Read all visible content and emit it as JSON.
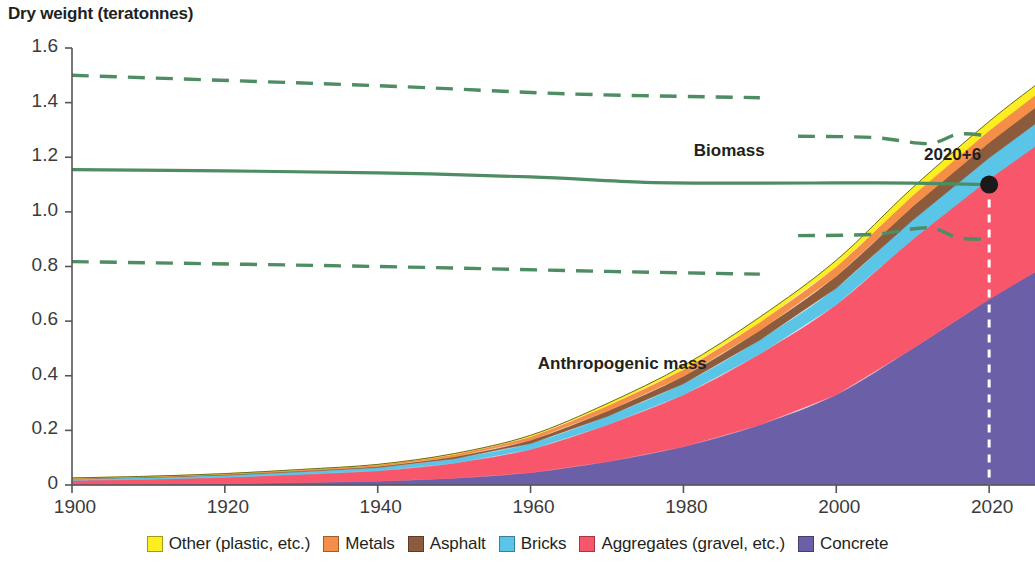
{
  "title": "Dry weight (teratonnes)",
  "labels": {
    "biomass": "Biomass",
    "anthropogenic": "Anthropogenic mass",
    "crossover_point": "2020+6"
  },
  "legend": {
    "items": [
      {
        "label": "Other (plastic, etc.)",
        "color": "#FCEE21"
      },
      {
        "label": "Metals",
        "color": "#F58E48"
      },
      {
        "label": "Asphalt",
        "color": "#8B5B3C"
      },
      {
        "label": "Bricks",
        "color": "#5BC5E8"
      },
      {
        "label": "Aggregates (gravel, etc.)",
        "color": "#F8576B"
      },
      {
        "label": "Concrete",
        "color": "#6B5FA8"
      }
    ]
  },
  "chart_data": {
    "type": "area",
    "title": "Dry weight (teratonnes)",
    "xlabel": "",
    "ylabel": "Dry weight (teratonnes)",
    "xlim": [
      1900,
      2026
    ],
    "ylim": [
      0,
      1.6
    ],
    "yticks": [
      "0",
      "0.2",
      "0.4",
      "0.6",
      "0.8",
      "1.0",
      "1.2",
      "1.4",
      "1.6"
    ],
    "ytick_values": [
      0,
      0.2,
      0.4,
      0.6,
      0.8,
      1.0,
      1.2,
      1.4,
      1.6
    ],
    "xticks": [
      "1900",
      "1920",
      "1940",
      "1960",
      "1980",
      "2000",
      "2020"
    ],
    "xtick_values": [
      1900,
      1920,
      1940,
      1960,
      1980,
      2000,
      2020
    ],
    "grid": false,
    "legend_position": "bottom",
    "stacked": true,
    "stack_order_bottom_to_top": [
      "Concrete",
      "Aggregates (gravel, etc.)",
      "Bricks",
      "Asphalt",
      "Metals",
      "Other (plastic, etc.)"
    ],
    "x": [
      1900,
      1910,
      1920,
      1930,
      1940,
      1950,
      1960,
      1970,
      1980,
      1990,
      2000,
      2010,
      2020,
      2026
    ],
    "series": [
      {
        "name": "Concrete",
        "color": "#6B5FA8",
        "values": [
          0.002,
          0.003,
          0.005,
          0.009,
          0.014,
          0.025,
          0.045,
          0.085,
          0.14,
          0.22,
          0.33,
          0.5,
          0.68,
          0.78
        ]
      },
      {
        "name": "Aggregates (gravel, etc.)",
        "color": "#F8576B",
        "values": [
          0.015,
          0.018,
          0.023,
          0.03,
          0.038,
          0.055,
          0.085,
          0.135,
          0.19,
          0.26,
          0.33,
          0.4,
          0.44,
          0.46
        ]
      },
      {
        "name": "Bricks",
        "color": "#5BC5E8",
        "values": [
          0.006,
          0.007,
          0.008,
          0.01,
          0.012,
          0.016,
          0.022,
          0.031,
          0.041,
          0.051,
          0.061,
          0.07,
          0.078,
          0.082
        ]
      },
      {
        "name": "Asphalt",
        "color": "#8B5B3C",
        "values": [
          0.001,
          0.0015,
          0.002,
          0.003,
          0.004,
          0.007,
          0.012,
          0.019,
          0.027,
          0.035,
          0.043,
          0.05,
          0.056,
          0.059
        ]
      },
      {
        "name": "Metals",
        "color": "#F58E48",
        "values": [
          0.0015,
          0.002,
          0.003,
          0.004,
          0.006,
          0.009,
          0.013,
          0.019,
          0.025,
          0.03,
          0.035,
          0.04,
          0.044,
          0.046
        ]
      },
      {
        "name": "Other (plastic, etc.)",
        "color": "#FCEE21",
        "values": [
          0.0005,
          0.0006,
          0.0008,
          0.001,
          0.0015,
          0.003,
          0.005,
          0.009,
          0.014,
          0.019,
          0.024,
          0.029,
          0.033,
          0.035
        ]
      }
    ],
    "anthropogenic_total": [
      0.026,
      0.032,
      0.042,
      0.057,
      0.076,
      0.115,
      0.182,
      0.298,
      0.437,
      0.615,
      0.823,
      1.089,
      1.331,
      1.462
    ],
    "biomass_line": {
      "name": "Biomass",
      "color": "#4E8C63",
      "style": "solid",
      "x": [
        1900,
        1920,
        1940,
        1960,
        1975,
        1990,
        2000,
        2010,
        2020
      ],
      "values": [
        1.155,
        1.15,
        1.143,
        1.128,
        1.108,
        1.105,
        1.106,
        1.105,
        1.1
      ]
    },
    "biomass_upper_bound": {
      "name": "Biomass upper uncertainty",
      "color": "#4E8C63",
      "style": "dashed",
      "segments": [
        {
          "x": [
            1900,
            1940,
            1965,
            1990
          ],
          "values": [
            1.5,
            1.462,
            1.432,
            1.418
          ]
        },
        {
          "x": [
            1995,
            2005,
            2012,
            2016,
            2020
          ],
          "values": [
            1.277,
            1.272,
            1.25,
            1.285,
            1.278
          ]
        }
      ]
    },
    "biomass_lower_bound": {
      "name": "Biomass lower uncertainty",
      "color": "#4E8C63",
      "style": "dashed",
      "segments": [
        {
          "x": [
            1900,
            1940,
            1970,
            1990
          ],
          "values": [
            0.818,
            0.8,
            0.782,
            0.772
          ]
        },
        {
          "x": [
            1995,
            2005,
            2012,
            2016,
            2020
          ],
          "values": [
            0.913,
            0.918,
            0.942,
            0.905,
            0.9
          ]
        }
      ]
    },
    "crossover": {
      "x": 2020,
      "y": 1.1,
      "label": "2020+6",
      "marker": "dot",
      "marker_color": "#1a1a1a"
    },
    "crossover_guide": {
      "style": "dashed",
      "color": "#ffffff",
      "x": 2020
    },
    "annotations": [
      {
        "text": "Biomass",
        "x": 1986,
        "y": 1.215
      },
      {
        "text": "Anthropogenic mass",
        "x": 1972,
        "y": 0.435
      }
    ]
  }
}
